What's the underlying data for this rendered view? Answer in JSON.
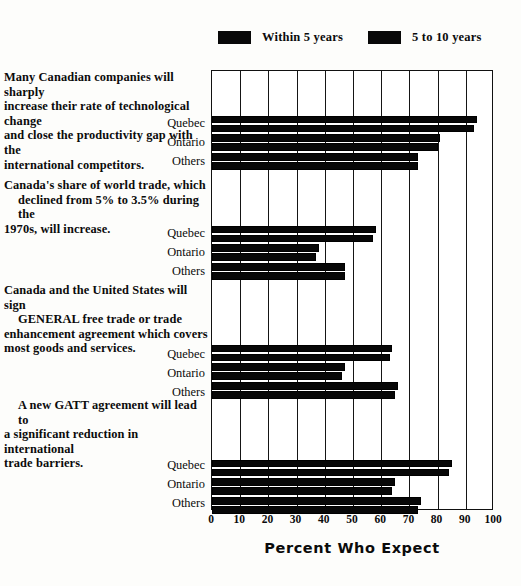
{
  "legend": {
    "items": [
      {
        "label": "Within 5 years",
        "color": "#080808",
        "icon": "legend-swatch-icon"
      },
      {
        "label": "5 to 10 years",
        "color": "#080808",
        "icon": "legend-swatch-icon"
      }
    ]
  },
  "axis": {
    "title": "Percent Who Expect",
    "ticks": [
      "0",
      "10",
      "20",
      "30",
      "40",
      "50",
      "60",
      "70",
      "80",
      "90",
      "100"
    ]
  },
  "questions": [
    {
      "lines": [
        "Many Canadian companies will sharply",
        "increase their rate of technological change",
        "and close the productivity gap with the",
        "international competitors."
      ],
      "regions": [
        "Quebec",
        "Ontario",
        "Others"
      ]
    },
    {
      "lines": [
        "Canada's share of world trade, which",
        "declined from 5% to 3.5% during the",
        "1970s, will increase."
      ],
      "regions": [
        "Quebec",
        "Ontario",
        "Others"
      ]
    },
    {
      "lines": [
        "Canada and the United States will sign",
        "GENERAL free trade or trade",
        "enhancement agreement which covers",
        "most goods and services."
      ],
      "regions": [
        "Quebec",
        "Ontario",
        "Others"
      ]
    },
    {
      "lines": [
        "A new GATT agreement will lead to",
        "a significant reduction in international",
        "trade barriers."
      ],
      "regions": [
        "Quebec",
        "Ontario",
        "Others"
      ]
    }
  ],
  "chart_data": {
    "type": "bar",
    "orientation": "horizontal",
    "title": "",
    "xlabel": "Percent Who Expect",
    "ylabel": "",
    "xlim": [
      0,
      100
    ],
    "xticks": [
      0,
      10,
      20,
      30,
      40,
      50,
      60,
      70,
      80,
      90,
      100
    ],
    "grid": true,
    "legend_position": "top",
    "series": [
      {
        "name": "Within 5 years",
        "color": "#080808"
      },
      {
        "name": "5 to 10 years",
        "color": "#080808"
      }
    ],
    "groups": [
      {
        "question": "Many Canadian companies will sharply increase their rate of technological change and close the productivity gap with the international competitors.",
        "categories": [
          "Quebec",
          "Ontario",
          "Others"
        ],
        "values": {
          "Within 5 years": [
            94,
            81,
            73
          ],
          "5 to 10 years": [
            93,
            80,
            73
          ]
        }
      },
      {
        "question": "Canada's share of world trade, which declined from 5% to 3.5% during the 1970s, will increase.",
        "categories": [
          "Quebec",
          "Ontario",
          "Others"
        ],
        "values": {
          "Within 5 years": [
            58,
            38,
            47
          ],
          "5 to 10 years": [
            57,
            37,
            47
          ]
        }
      },
      {
        "question": "Canada and the United States will sign GENERAL free trade or trade enhancement agreement which covers most goods and services.",
        "categories": [
          "Quebec",
          "Ontario",
          "Others"
        ],
        "values": {
          "Within 5 years": [
            64,
            47,
            66
          ],
          "5 to 10 years": [
            63,
            46,
            65
          ]
        }
      },
      {
        "question": "A new GATT agreement will lead to a significant reduction in international trade barriers.",
        "categories": [
          "Quebec",
          "Ontario",
          "Others"
        ],
        "values": {
          "Within 5 years": [
            85,
            65,
            74
          ],
          "5 to 10 years": [
            84,
            64,
            73
          ]
        }
      }
    ]
  }
}
